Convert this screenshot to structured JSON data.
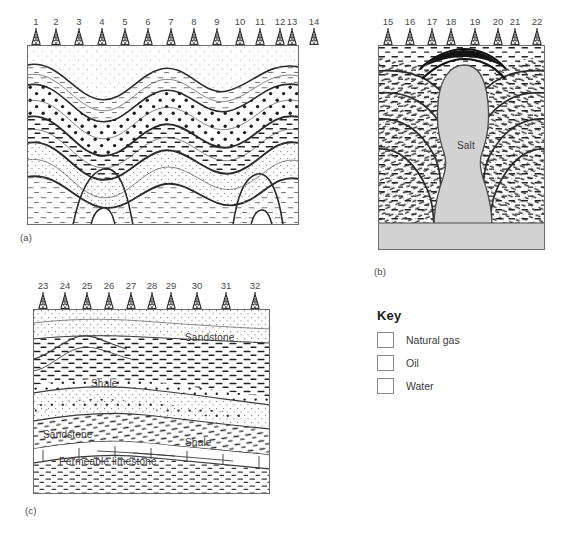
{
  "figure": {
    "panels": [
      {
        "id": "a",
        "caption": "(a)",
        "trap_type": "anticline",
        "wells": [
          "1",
          "2",
          "3",
          "4",
          "5",
          "6",
          "7",
          "8",
          "9",
          "10",
          "11",
          "12",
          "13",
          "14"
        ],
        "labels": []
      },
      {
        "id": "b",
        "caption": "(b)",
        "trap_type": "salt-dome",
        "wells": [
          "15",
          "16",
          "17",
          "18",
          "19",
          "20",
          "21",
          "22"
        ],
        "labels": [
          {
            "text": "Salt",
            "x": 88,
            "y": 100
          }
        ]
      },
      {
        "id": "c",
        "caption": "(c)",
        "trap_type": "stratigraphic",
        "wells": [
          "23",
          "24",
          "25",
          "26",
          "27",
          "28",
          "29",
          "30",
          "31",
          "32"
        ],
        "labels": [
          {
            "text": "Sandstone",
            "x": 152,
            "y": 28
          },
          {
            "text": "Shale",
            "x": 58,
            "y": 74
          },
          {
            "text": "Sandstone",
            "x": 12,
            "y": 125
          },
          {
            "text": "Shale",
            "x": 154,
            "y": 133
          },
          {
            "text": "Permeable limestone",
            "x": 28,
            "y": 174
          }
        ]
      }
    ]
  },
  "key": {
    "title": "Key",
    "items": [
      {
        "label": "Natural gas",
        "swatch": "natural-gas-swatch"
      },
      {
        "label": "Oil",
        "swatch": "oil-swatch"
      },
      {
        "label": "Water",
        "swatch": "water-swatch"
      }
    ]
  },
  "colors": {
    "line": "#2b2b2b",
    "frame": "#6d6d6d",
    "salt_fill": "#d2d2d2",
    "text": "#3b3b3b",
    "page_background": "#ffffff"
  },
  "icons": {
    "derrick": "oil-derrick-icon"
  }
}
